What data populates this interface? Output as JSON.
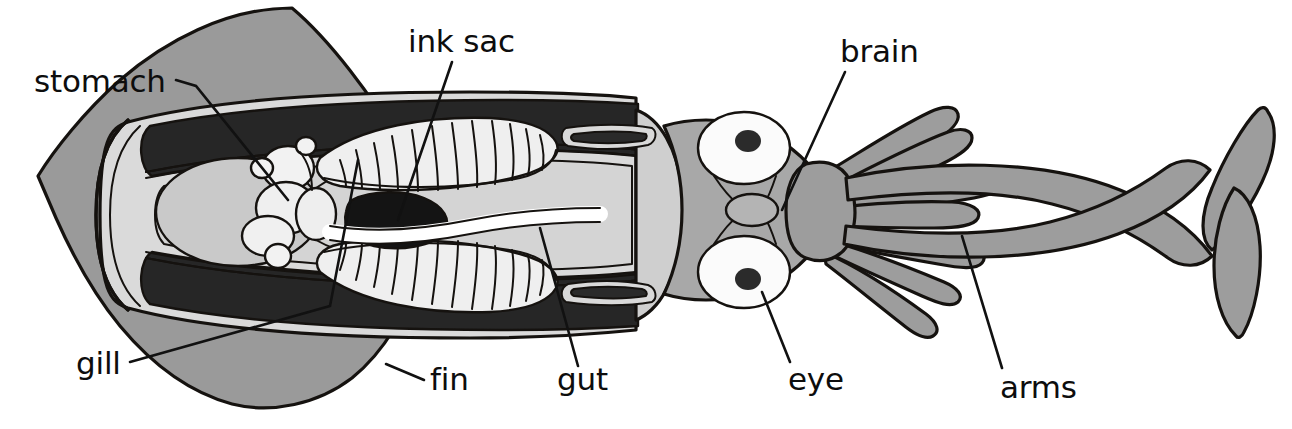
{
  "figure": {
    "title": "",
    "view": "dorsal dissection, whole animal left-to-right",
    "background_color": "#ffffff"
  },
  "palette": {
    "outline": "#15120f",
    "ink_black": "#222222",
    "mantle_dark_band": "#262626",
    "fin_gray": "#9a9a9a",
    "arm_gray": "#9d9d9d",
    "head_gray": "#a8a8a8",
    "organ_light": "#d8d8d8",
    "organ_lighter": "#e6e6e6",
    "white": "#ffffff",
    "label_text": "#0d0d0d",
    "leader_line": "#111111"
  },
  "labels": [
    {
      "id": "stomach",
      "text": "stomach",
      "text_x": 34,
      "text_y": 92,
      "anchor": "start",
      "leader": "M 176,80 L 196,86 L 288,200",
      "points_to": "stomach sac inside mantle cavity, left-centre"
    },
    {
      "id": "ink-sac",
      "text": "ink sac",
      "text_x": 408,
      "text_y": 52,
      "anchor": "start",
      "leader": "M 452,62 L 398,220",
      "points_to": "black ink sac at mid-body"
    },
    {
      "id": "brain",
      "text": "brain",
      "text_x": 840,
      "text_y": 62,
      "anchor": "start",
      "leader": "M 845,72 L 782,210",
      "points_to": "small oval brain between the two eyes"
    },
    {
      "id": "gill",
      "text": "gill",
      "text_x": 76,
      "text_y": 374,
      "anchor": "start",
      "leader": "M 130,362 L 330,306 L 358,160",
      "points_to": "feathered gill, left mantle cavity"
    },
    {
      "id": "fin",
      "text": "fin",
      "text_x": 430,
      "text_y": 390,
      "anchor": "start",
      "leader": "M 424,380 L 386,364",
      "points_to": "lateral fin lobe at posterior mantle"
    },
    {
      "id": "gut",
      "text": "gut",
      "text_x": 557,
      "text_y": 390,
      "anchor": "start",
      "leader": "M 578,366 L 540,228",
      "points_to": "gut tube running to the funnel"
    },
    {
      "id": "eye",
      "text": "eye",
      "text_x": 788,
      "text_y": 390,
      "anchor": "start",
      "leader": "M 790,362 L 762,292",
      "points_to": "lower eye of the head"
    },
    {
      "id": "arms",
      "text": "arms",
      "text_x": 1000,
      "text_y": 398,
      "anchor": "start",
      "leader": "M 1002,368 L 962,236",
      "points_to": "arm crown around the mouth"
    }
  ],
  "anatomy_parts": [
    {
      "name": "fin",
      "description": "large diamond-shaped posterior fin lobes, medium gray"
    },
    {
      "name": "mantle",
      "description": "muscular body tube, opened to show cavity"
    },
    {
      "name": "mantle-dark-band",
      "description": "dark near-black band lining the mantle wall"
    },
    {
      "name": "stomach",
      "description": "pale rounded sac left of centre"
    },
    {
      "name": "caecum",
      "description": "large pale oval posterior to the stomach"
    },
    {
      "name": "organ-cluster",
      "description": "group of small pale lobes beside the stomach"
    },
    {
      "name": "gill-upper",
      "description": "feathered gill with about 13 filaments, upper cavity"
    },
    {
      "name": "gill-lower",
      "description": "feathered gill with about 13 filaments, lower cavity"
    },
    {
      "name": "ink-sac",
      "description": "solid black teardrop organ at mid-body"
    },
    {
      "name": "gut",
      "description": "pale tube running forward from the ink sac to the funnel"
    },
    {
      "name": "funnel",
      "description": "siphon collar with two slit openings"
    },
    {
      "name": "head",
      "description": "gray head bearing the two eyes"
    },
    {
      "name": "eye-upper",
      "description": "white eyeball with dark round pupil"
    },
    {
      "name": "eye-lower",
      "description": "white eyeball with dark round pupil"
    },
    {
      "name": "brain",
      "description": "small gray oval between the eyes"
    },
    {
      "name": "arms",
      "description": "eight short tapering arms forming the crown"
    },
    {
      "name": "tentacles",
      "description": "two long feeding tentacles ending in leaf-shaped clubs, crossing at the right"
    }
  ]
}
